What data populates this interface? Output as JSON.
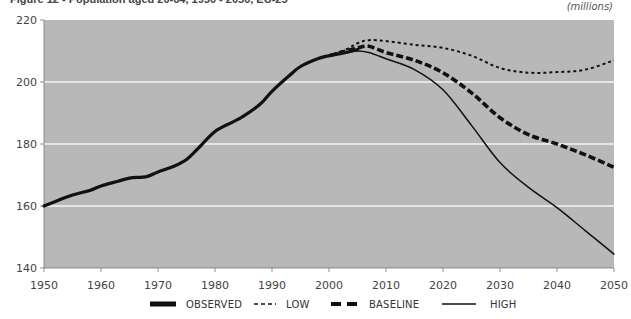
{
  "header": {
    "title": "Figure 12 - Population aged 20-64, 1950 - 2050, EU-25",
    "units": "(millions)"
  },
  "legend": [
    {
      "key": "observed",
      "label": "OBSERVED"
    },
    {
      "key": "low",
      "label": "LOW"
    },
    {
      "key": "baseline",
      "label": "BASELINE"
    },
    {
      "key": "high",
      "label": "HIGH"
    }
  ],
  "colors": {
    "plot_background": "#b8b8b8",
    "gridline": "#f4f4f4",
    "series": "#111111"
  },
  "chart_data": {
    "type": "line",
    "title": "Population aged 20-64, 1950 - 2050",
    "xlabel": "",
    "ylabel": "(millions)",
    "xlim": [
      1950,
      2050
    ],
    "ylim": [
      140,
      220
    ],
    "x_ticks": [
      1950,
      1960,
      1970,
      1980,
      1990,
      2000,
      2010,
      2020,
      2030,
      2040,
      2050
    ],
    "y_ticks": [
      140,
      160,
      180,
      200,
      220
    ],
    "grid": {
      "horizontal": true,
      "vertical": false,
      "lines_at": [
        160,
        180,
        200
      ]
    },
    "legend_position": "bottom",
    "series": [
      {
        "name": "OBSERVED",
        "style": "thick-solid",
        "x": [
          1950,
          1952,
          1955,
          1958,
          1960,
          1963,
          1965,
          1968,
          1970,
          1973,
          1975,
          1977,
          1980,
          1983,
          1985,
          1988,
          1990,
          1993,
          1995,
          1998,
          2000,
          2003,
          2005
        ],
        "values": [
          160,
          161.5,
          163.5,
          165,
          166.5,
          168,
          169,
          169.5,
          171,
          173,
          175,
          178.5,
          184,
          187,
          189,
          193,
          197,
          202,
          205,
          207.5,
          208.5,
          209.5,
          210.5
        ]
      },
      {
        "name": "LOW",
        "style": "dotted",
        "x": [
          2000,
          2003,
          2005,
          2007,
          2010,
          2015,
          2020,
          2025,
          2030,
          2035,
          2040,
          2045,
          2050
        ],
        "values": [
          208.5,
          210.5,
          212.5,
          213.5,
          213.2,
          212,
          211,
          208.5,
          204.5,
          203,
          203.2,
          204,
          207
        ]
      },
      {
        "name": "BASELINE",
        "style": "thick-dashed",
        "x": [
          2000,
          2003,
          2005,
          2007,
          2010,
          2015,
          2020,
          2025,
          2030,
          2035,
          2040,
          2045,
          2050
        ],
        "values": [
          208.5,
          210,
          211,
          211.5,
          209.5,
          207,
          203,
          196.5,
          188.5,
          183,
          180,
          176.5,
          172.5
        ]
      },
      {
        "name": "HIGH",
        "style": "solid",
        "x": [
          2000,
          2003,
          2005,
          2007,
          2010,
          2015,
          2020,
          2025,
          2030,
          2035,
          2040,
          2045,
          2050
        ],
        "values": [
          208.5,
          209.5,
          210,
          209.5,
          207.5,
          204,
          197.5,
          186,
          174,
          166,
          159.5,
          152,
          144.5
        ]
      }
    ]
  }
}
